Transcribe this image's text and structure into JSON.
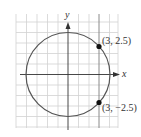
{
  "diagram": {
    "type": "circle-on-grid",
    "axes": {
      "x_label": "x",
      "y_label": "y"
    },
    "circle": {
      "center": [
        0,
        0
      ],
      "radius_squared": 15.25
    },
    "points": [
      {
        "label": "(3, 2.5)",
        "x": 3,
        "y": 2.5
      },
      {
        "label": "(3, −2.5)",
        "x": 3,
        "y": -2.5
      }
    ],
    "vertical_line": {
      "x": 3
    },
    "colors": {
      "grid": "#d0d0d0",
      "axis": "#333333",
      "circle": "#555555",
      "point": "#111111"
    }
  }
}
